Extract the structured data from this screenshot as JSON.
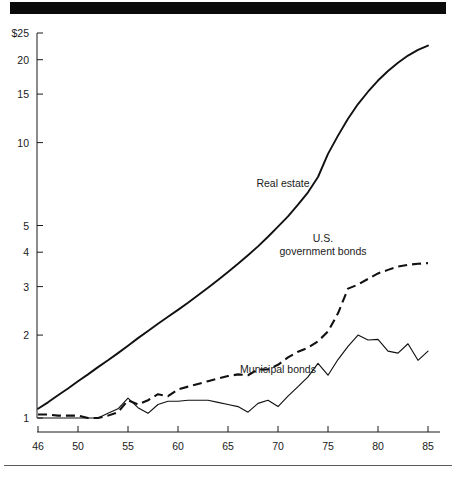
{
  "figure": {
    "top_bar": "solid-black-rule",
    "bottom_rule": "thin-horizontal-rule"
  },
  "chart_data": {
    "type": "line",
    "title": "",
    "subtitle": "",
    "xlabel": "",
    "ylabel": "",
    "yscale": "log",
    "xscale": "linear",
    "grid": false,
    "legend": "inline-annotations",
    "xlim": [
      46,
      85
    ],
    "ylim": [
      1,
      25
    ],
    "x_tick_labels": [
      "46",
      "50",
      "55",
      "60",
      "65",
      "70",
      "75",
      "80",
      "85"
    ],
    "x_tick_values": [
      46,
      50,
      55,
      60,
      65,
      70,
      75,
      80,
      85
    ],
    "y_tick_labels": [
      "$25",
      "20",
      "15",
      "10",
      "5",
      "4",
      "3",
      "2",
      "1"
    ],
    "y_tick_values": [
      25,
      20,
      15,
      10,
      5,
      4,
      3,
      2,
      1
    ],
    "series": [
      {
        "name": "Real estate",
        "style": "solid-thick",
        "label_x": 70.5,
        "label_y": 6.9,
        "x": [
          46,
          47,
          48,
          49,
          50,
          51,
          52,
          53,
          54,
          55,
          56,
          57,
          58,
          59,
          60,
          61,
          62,
          63,
          64,
          65,
          66,
          67,
          68,
          69,
          70,
          71,
          72,
          73,
          74,
          75,
          76,
          77,
          78,
          79,
          80,
          81,
          82,
          83,
          84,
          85
        ],
        "y": [
          1.08,
          1.14,
          1.21,
          1.28,
          1.36,
          1.44,
          1.53,
          1.62,
          1.72,
          1.83,
          1.95,
          2.07,
          2.2,
          2.33,
          2.47,
          2.62,
          2.79,
          2.97,
          3.17,
          3.39,
          3.63,
          3.9,
          4.2,
          4.55,
          4.95,
          5.4,
          5.95,
          6.6,
          7.5,
          9.1,
          10.6,
          12.2,
          13.8,
          15.3,
          16.8,
          18.2,
          19.5,
          20.7,
          21.7,
          22.5
        ]
      },
      {
        "name": "U.S. government bonds",
        "style": "dashed",
        "label_line1": "U.S.",
        "label_line2": "government bonds",
        "label_x": 74.5,
        "label_y": 4.35,
        "x": [
          46,
          47,
          48,
          49,
          50,
          51,
          52,
          53,
          54,
          55,
          56,
          57,
          58,
          59,
          60,
          61,
          62,
          63,
          64,
          65,
          66,
          67,
          68,
          69,
          70,
          71,
          72,
          73,
          74,
          75,
          76,
          77,
          78,
          79,
          80,
          81,
          82,
          83,
          84,
          85
        ],
        "y": [
          1.03,
          1.03,
          1.02,
          1.02,
          1.02,
          1.0,
          1.0,
          1.02,
          1.05,
          1.16,
          1.12,
          1.16,
          1.22,
          1.2,
          1.27,
          1.3,
          1.33,
          1.36,
          1.39,
          1.42,
          1.44,
          1.43,
          1.5,
          1.5,
          1.56,
          1.66,
          1.74,
          1.8,
          1.9,
          2.06,
          2.4,
          2.95,
          3.05,
          3.2,
          3.35,
          3.45,
          3.55,
          3.6,
          3.63,
          3.65
        ]
      },
      {
        "name": "Municipal bonds",
        "style": "solid-thin",
        "label_x": 70.0,
        "label_y": 1.46,
        "x": [
          46,
          47,
          48,
          49,
          50,
          51,
          52,
          53,
          54,
          55,
          56,
          57,
          58,
          59,
          60,
          61,
          62,
          63,
          64,
          65,
          66,
          67,
          68,
          69,
          70,
          71,
          72,
          73,
          74,
          75,
          76,
          77,
          78,
          79,
          80,
          81,
          82,
          83,
          84,
          85
        ],
        "y": [
          1.0,
          1.0,
          1.0,
          1.0,
          1.0,
          1.0,
          1.0,
          1.04,
          1.08,
          1.18,
          1.09,
          1.04,
          1.12,
          1.15,
          1.15,
          1.16,
          1.16,
          1.16,
          1.14,
          1.12,
          1.1,
          1.05,
          1.13,
          1.16,
          1.1,
          1.2,
          1.3,
          1.41,
          1.58,
          1.43,
          1.63,
          1.82,
          2.0,
          1.92,
          1.93,
          1.75,
          1.72,
          1.86,
          1.62,
          1.75
        ]
      }
    ]
  }
}
